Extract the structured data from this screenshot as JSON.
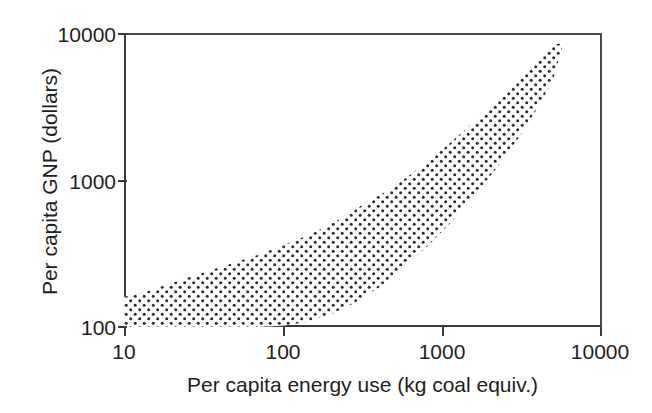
{
  "chart_data": {
    "type": "area",
    "title": "",
    "subtitle": "",
    "xlabel": "Per capita energy use (kg coal equiv.)",
    "ylabel": "Per capita GNP (dollars)",
    "xscale": "log",
    "yscale": "log",
    "xlim": [
      10,
      10000
    ],
    "ylim": [
      100,
      10000
    ],
    "xticks": [
      10,
      100,
      1000,
      10000
    ],
    "xtick_labels": [
      "10",
      "100",
      "1000",
      "10000"
    ],
    "yticks": [
      100,
      1000,
      10000
    ],
    "ytick_labels": [
      "100",
      "1000",
      "10000"
    ],
    "grid": false,
    "legend": null,
    "annotations": [],
    "series": [
      {
        "name": "Country scatter envelope (stippled band)",
        "style": "stippled / dotted fill",
        "fill_pattern": "dot-stipple",
        "upper_boundary": {
          "x": [
            10,
            14,
            20,
            30,
            45,
            70,
            100,
            150,
            220,
            320,
            500,
            750,
            1100,
            1600,
            2300,
            3200,
            4300,
            5200,
            5800
          ],
          "y": [
            160,
            175,
            200,
            230,
            265,
            310,
            360,
            430,
            530,
            680,
            900,
            1250,
            1750,
            2500,
            3600,
            5200,
            7200,
            8400,
            8600
          ]
        },
        "lower_boundary": {
          "x": [
            10,
            20,
            40,
            70,
            100,
            140,
            200,
            280,
            400,
            560,
            800,
            1150,
            1600,
            2200,
            3000,
            4000,
            5000,
            5800
          ],
          "y": [
            100,
            100,
            100,
            100,
            102,
            108,
            122,
            145,
            185,
            250,
            350,
            520,
            780,
            1200,
            1900,
            3100,
            4800,
            8600
          ]
        }
      }
    ]
  },
  "axes": {
    "y_ticks": [
      {
        "label": "10000",
        "value": 10000
      },
      {
        "label": "1000",
        "value": 1000
      },
      {
        "label": "100",
        "value": 100
      }
    ],
    "x_ticks": [
      {
        "label": "10",
        "value": 10
      },
      {
        "label": "100",
        "value": 100
      },
      {
        "label": "1000",
        "value": 1000
      },
      {
        "label": "10000",
        "value": 10000
      }
    ],
    "y_title": "Per capita GNP (dollars)",
    "x_title": "Per capita energy use (kg coal equiv.)"
  },
  "colors": {
    "axis": "#3a3a3a",
    "text": "#1e1e1e",
    "stipple": "#2b2b2b",
    "background": "#ffffff"
  }
}
